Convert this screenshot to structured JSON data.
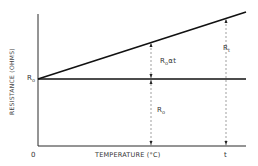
{
  "diagram": {
    "y_axis_label": "RESISTANCE (OHMS)",
    "x_axis_label": "TEMPERATURE (°C)",
    "origin_label": "0",
    "t_label": "t",
    "r0_axis_label": "R",
    "r0_axis_sub": "o",
    "r0_alpha_t_main": "R",
    "r0_alpha_t_sub": "o",
    "r0_alpha_t_tail": "αt",
    "r0_span_main": "R",
    "r0_span_sub": "o",
    "rt_main": "R",
    "rt_sub": "t"
  },
  "colors": {
    "line": "#1a1a1a",
    "dashed": "#777777",
    "text": "#333333"
  }
}
